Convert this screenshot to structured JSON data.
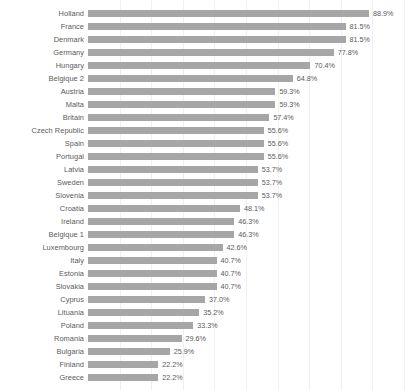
{
  "chart_data": {
    "type": "bar",
    "orientation": "horizontal",
    "title": "",
    "subtitle": "",
    "xlabel": "",
    "ylabel": "",
    "xlim": [
      0,
      100
    ],
    "grid": true,
    "legend": null,
    "value_suffix": "%",
    "colors": {
      "bar": "#a6a6a6",
      "text": "#5a5a5a",
      "grid": "#f0f0f0",
      "background": "#ffffff"
    },
    "categories": [
      "Holland",
      "France",
      "Denmark",
      "Germany",
      "Hungary",
      "Belgique 2",
      "Austria",
      "Malta",
      "Britain",
      "Czech Republic",
      "Spain",
      "Portugal",
      "Latvia",
      "Sweden",
      "Slovenia",
      "Croatia",
      "Ireland",
      "Belgique 1",
      "Luxembourg",
      "Italy",
      "Estonia",
      "Slovakia",
      "Cyprus",
      "Lituania",
      "Poland",
      "Romania",
      "Bulgaria",
      "Finland",
      "Greece"
    ],
    "values": [
      88.9,
      81.5,
      81.5,
      77.8,
      70.4,
      64.8,
      59.3,
      59.3,
      57.4,
      55.6,
      55.6,
      55.6,
      53.7,
      53.7,
      53.7,
      48.1,
      46.3,
      46.3,
      42.6,
      40.7,
      40.7,
      40.7,
      37.0,
      35.2,
      33.3,
      29.6,
      25.9,
      22.2,
      22.2
    ],
    "value_labels": [
      "88.9%",
      "81.5%",
      "81.5%",
      "77.8%",
      "70.4%",
      "64.8%",
      "59.3%",
      "59.3%",
      "57.4%",
      "55.6%",
      "55.6%",
      "55.6%",
      "53.7%",
      "53.7%",
      "53.7%",
      "48.1%",
      "46.3%",
      "46.3%",
      "42.6%",
      "40.7%",
      "40.7%",
      "40.7%",
      "37.0%",
      "35.2%",
      "33.3%",
      "29.6%",
      "25.9%",
      "22.2%",
      "22.2%"
    ],
    "gridline_values": [
      10,
      20,
      30,
      40,
      50,
      60,
      70,
      80,
      90,
      100
    ]
  }
}
